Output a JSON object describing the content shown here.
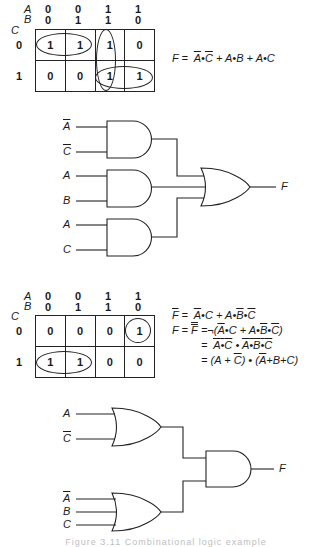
{
  "kmap1": {
    "var_labels": {
      "row1": "A",
      "row2": "B",
      "side": "C"
    },
    "col_headers_A": [
      "0",
      "0",
      "1",
      "1"
    ],
    "col_headers_B": [
      "0",
      "1",
      "1",
      "0"
    ],
    "row_headers_C": [
      "0",
      "1"
    ],
    "cells": [
      [
        "1",
        "1",
        "1",
        "0"
      ],
      [
        "0",
        "0",
        "1",
        "1"
      ]
    ],
    "groupings": [
      "row0 cols0-1",
      "col2 rows0-1",
      "row1 cols2-3"
    ]
  },
  "equation1": {
    "lhs": "F",
    "rhs": "= Ā•C̄ + A•B + A•C",
    "parts": [
      "F =",
      "A",
      "•",
      "C",
      "+ A•B + A•C"
    ]
  },
  "circuit1": {
    "inputs": [
      "A",
      "C",
      "A",
      "B",
      "A",
      "C"
    ],
    "input_negated": [
      true,
      true,
      false,
      false,
      false,
      false
    ],
    "gates": [
      "AND",
      "AND",
      "AND",
      "OR"
    ],
    "output": "F"
  },
  "kmap2": {
    "var_labels": {
      "row1": "A",
      "row2": "B",
      "side": "C"
    },
    "col_headers_A": [
      "0",
      "0",
      "1",
      "1"
    ],
    "col_headers_B": [
      "0",
      "1",
      "1",
      "0"
    ],
    "row_headers_C": [
      "0",
      "1"
    ],
    "cells": [
      [
        "0",
        "0",
        "0",
        "1"
      ],
      [
        "1",
        "1",
        "0",
        "0"
      ]
    ],
    "groupings": [
      "row0 col3",
      "row1 cols0-1"
    ]
  },
  "equations2": [
    "F̄ = Ā•C + A•B̄•C̄",
    "F = F̿ = ¬(Ā•C + A•B̄•C̄)",
    "= (Ā•C)‾ • (A•B̄•C̄)‾",
    "= (A + C̄) • (Ā + B + C)"
  ],
  "eq2": {
    "F": "F",
    "eq": "=",
    "A": "A",
    "B": "B",
    "C": "C",
    "dot": "•",
    "plus": "+",
    "not": "¬",
    "lp": "(",
    "rp": ")"
  },
  "circuit2": {
    "inputs": [
      "A",
      "C",
      "A",
      "B",
      "C"
    ],
    "input_negated": [
      false,
      true,
      true,
      false,
      false
    ],
    "gates": [
      "OR",
      "OR",
      "AND"
    ],
    "output": "F"
  },
  "caption": "Figure 3.11   Combinational logic example"
}
